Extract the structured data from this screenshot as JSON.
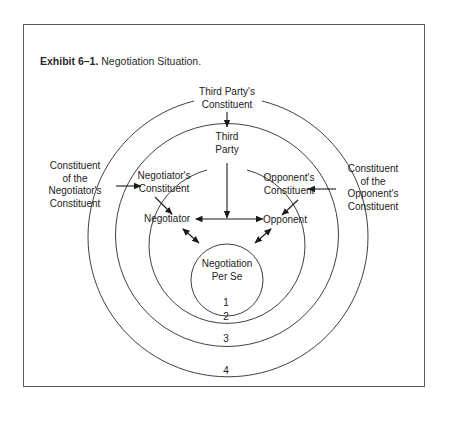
{
  "caption": {
    "number": "Exhibit 6–1.",
    "title": "Negotiation Situation."
  },
  "nodes": {
    "third_party_constituent": [
      "Third Party's",
      "Constituent"
    ],
    "third_party": [
      "Third",
      "Party"
    ],
    "negotiators_constituent": [
      "Negotiator's",
      "Constituent"
    ],
    "opponents_constituent": [
      "Opponent's",
      "Constituent"
    ],
    "constituent_of_negotiators_constituent": [
      "Constituent",
      "of the",
      "Negotiator's",
      "Constituent"
    ],
    "constituent_of_opponents_constituent": [
      "Constituent",
      "of the",
      "Opponent's",
      "Constituent"
    ],
    "negotiator": "Negotiator",
    "opponent": "Opponent",
    "negotiation_per_se": [
      "Negotiation",
      "Per Se"
    ]
  },
  "rings": {
    "r1": "1",
    "r2": "2",
    "r3": "3",
    "r4": "4"
  },
  "colors": {
    "line": "#2a2a2a",
    "frame": "#5a5a5a",
    "background": "#ffffff"
  }
}
